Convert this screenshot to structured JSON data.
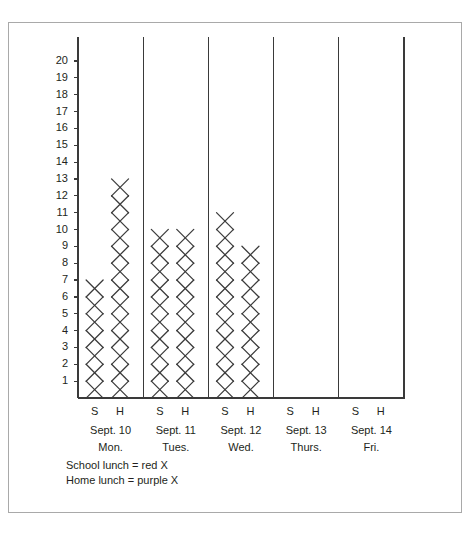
{
  "chart_data": {
    "type": "bar",
    "title": "",
    "subtitle": "",
    "xlabel": "",
    "ylabel": "",
    "ylim": [
      0,
      20
    ],
    "grid": false,
    "legend_position": "below-axis-left",
    "notation": "pictograph: each X mark represents 1 student",
    "categories": [
      "Sept. 10 Mon.",
      "Sept. 11 Tues.",
      "Sept. 12 Wed.",
      "Sept. 13 Thurs.",
      "Sept. 14 Fri."
    ],
    "subcategories": [
      "S",
      "H"
    ],
    "series": [
      {
        "name": "S",
        "values": [
          7,
          10,
          11,
          0,
          0
        ]
      },
      {
        "name": "H",
        "values": [
          13,
          10,
          9,
          0,
          0
        ]
      }
    ],
    "columns": [
      {
        "day_index": 0,
        "subcategory": "S",
        "value": 7
      },
      {
        "day_index": 0,
        "subcategory": "H",
        "value": 13
      },
      {
        "day_index": 1,
        "subcategory": "S",
        "value": 10
      },
      {
        "day_index": 1,
        "subcategory": "H",
        "value": 10
      },
      {
        "day_index": 2,
        "subcategory": "S",
        "value": 11
      },
      {
        "day_index": 2,
        "subcategory": "H",
        "value": 9
      },
      {
        "day_index": 3,
        "subcategory": "S",
        "value": 0
      },
      {
        "day_index": 3,
        "subcategory": "H",
        "value": 0
      },
      {
        "day_index": 4,
        "subcategory": "S",
        "value": 0
      },
      {
        "day_index": 4,
        "subcategory": "H",
        "value": 0
      }
    ],
    "ytick_labels": [
      "20",
      "19",
      "18",
      "17",
      "16",
      "15",
      "14",
      "13",
      "12",
      "11",
      "10",
      "9",
      "8",
      "7",
      "6",
      "5",
      "4",
      "3",
      "2",
      "1"
    ],
    "ytick_values": [
      20,
      19,
      18,
      17,
      16,
      15,
      14,
      13,
      12,
      11,
      10,
      9,
      8,
      7,
      6,
      5,
      4,
      3,
      2,
      1
    ],
    "legend": [
      "School lunch = red X",
      "Home lunch = purple X"
    ],
    "mark_color": "#3a3a3a",
    "axis_color": "#3a3a3a",
    "frame_color": "#a9a9a9",
    "text_color": "#231f20"
  },
  "axis": {
    "days": [
      {
        "date": "Sept. 10",
        "name": "Mon.",
        "s_label": "S",
        "h_label": "H"
      },
      {
        "date": "Sept. 11",
        "name": "Tues.",
        "s_label": "S",
        "h_label": "H"
      },
      {
        "date": "Sept. 12",
        "name": "Wed.",
        "s_label": "S",
        "h_label": "H"
      },
      {
        "date": "Sept. 13",
        "name": "Thurs.",
        "s_label": "S",
        "h_label": "H"
      },
      {
        "date": "Sept. 14",
        "name": "Fri.",
        "s_label": "S",
        "h_label": "H"
      }
    ]
  },
  "legend": {
    "line1": "School lunch = red X",
    "line2": "Home lunch = purple X"
  }
}
